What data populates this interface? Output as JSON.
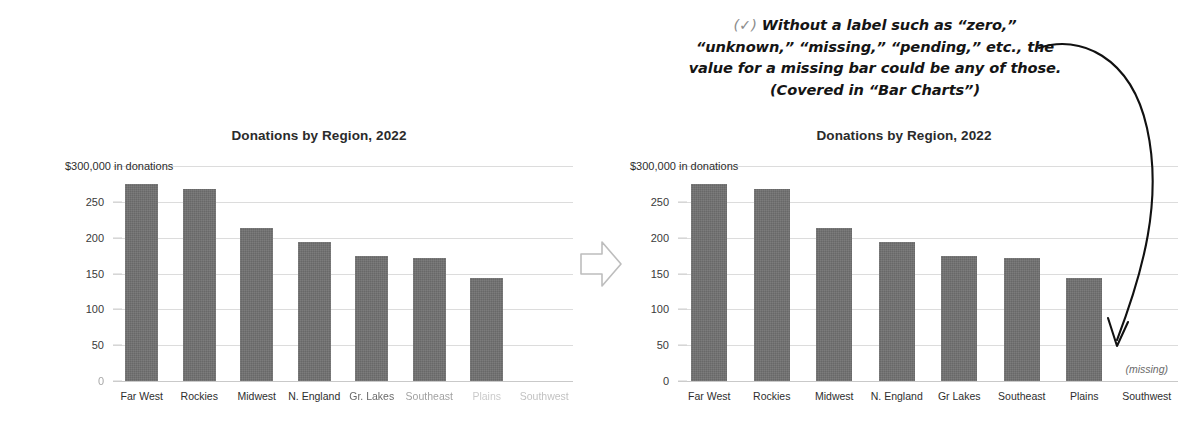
{
  "annotation": {
    "check_glyph": "(✓)",
    "lines": [
      "Without a label such as “zero,”",
      "“unknown,” “missing,” “pending,” etc., the",
      "value for a missing bar could be any of those.",
      "(Covered in “Bar Charts”)"
    ],
    "arrow_icon": "curved-down-arrow"
  },
  "transform_arrow": {
    "icon": "block-right-arrow"
  },
  "colors": {
    "bar": "#6f6f6f",
    "gridline": "#dcdcdc",
    "title": "#2b2b2b",
    "annotation": "#151515",
    "check": "#8c8c8c",
    "missing_note": "#6a6a6a"
  },
  "chart_data": [
    {
      "id": "before",
      "type": "bar",
      "title": "Donations by Region, 2022",
      "xlabel": "",
      "ylabel": "$300,000 in donations",
      "ytick_top_label": "$300,000 in donations",
      "yticks": [
        0,
        50,
        100,
        150,
        200,
        250,
        300
      ],
      "ytick_labels": [
        "0",
        "50",
        "100",
        "150",
        "200",
        "250",
        "$300,000 in donations"
      ],
      "ylim": [
        0,
        300
      ],
      "grid": true,
      "legend": "none",
      "categories": [
        "Far West",
        "Rockies",
        "Midwest",
        "N. England",
        "Gr. Lakes",
        "Southeast",
        "Plains",
        "Southwest"
      ],
      "values": [
        275,
        268,
        214,
        194,
        175,
        171,
        144,
        null
      ],
      "label_fade": [
        0,
        0,
        0,
        0,
        1,
        2,
        3,
        4
      ],
      "note": "Southwest bar absent and unlabeled"
    },
    {
      "id": "after",
      "type": "bar",
      "title": "Donations by Region, 2022",
      "xlabel": "",
      "ylabel": "$300,000 in donations",
      "ytick_top_label": "$300,000 in donations",
      "yticks": [
        0,
        50,
        100,
        150,
        200,
        250,
        300
      ],
      "ytick_labels": [
        "0",
        "50",
        "100",
        "150",
        "200",
        "250",
        "$300,000 in donations"
      ],
      "ylim": [
        0,
        300
      ],
      "grid": true,
      "legend": "none",
      "categories": [
        "Far West",
        "Rockies",
        "Midwest",
        "N. England",
        "Gr Lakes",
        "Southeast",
        "Plains",
        "Southwest"
      ],
      "values": [
        275,
        268,
        214,
        194,
        175,
        171,
        144,
        null
      ],
      "label_fade": [
        0,
        0,
        0,
        0,
        0,
        0,
        0,
        0
      ],
      "annotations": [
        {
          "category": "Southwest",
          "text": "(missing)"
        }
      ]
    }
  ]
}
